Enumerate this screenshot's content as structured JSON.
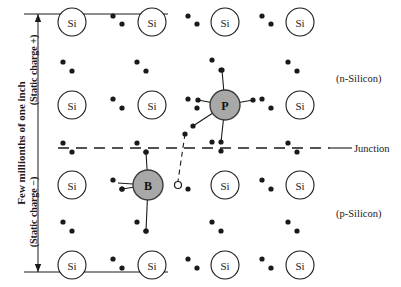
{
  "diagram": {
    "colors": {
      "ink": "#1a1a1a",
      "dopant_fill": "#a8a8a8",
      "atom_fill": "#ffffff",
      "background": "#ffffff"
    },
    "labels": {
      "dimension_main": "Few millionths of one inch",
      "static_charge_positive": "(Static charge +)",
      "static_charge_negative": "(Static charge −)",
      "n_region": "(n-Silicon)",
      "p_region": "(p-Silicon)",
      "junction": "Junction"
    },
    "atom_symbols": {
      "silicon": "Si",
      "phosphorus": "P",
      "boron": "B"
    },
    "silicon_atoms": [
      {
        "x": 72,
        "y": 22,
        "label": "Si"
      },
      {
        "x": 152,
        "y": 22,
        "label": "Si"
      },
      {
        "x": 225,
        "y": 22,
        "label": "Si"
      },
      {
        "x": 300,
        "y": 22,
        "label": "Si"
      },
      {
        "x": 72,
        "y": 105,
        "label": "Si"
      },
      {
        "x": 152,
        "y": 105,
        "label": "Si"
      },
      {
        "x": 300,
        "y": 105,
        "label": "Si"
      },
      {
        "x": 72,
        "y": 185,
        "label": "Si"
      },
      {
        "x": 225,
        "y": 185,
        "label": "Si"
      },
      {
        "x": 300,
        "y": 185,
        "label": "Si"
      },
      {
        "x": 72,
        "y": 265,
        "label": "Si"
      },
      {
        "x": 152,
        "y": 265,
        "label": "Si"
      },
      {
        "x": 225,
        "y": 265,
        "label": "Si"
      },
      {
        "x": 300,
        "y": 265,
        "label": "Si"
      }
    ],
    "dopant_atoms": [
      {
        "x": 225,
        "y": 105,
        "label": "P",
        "region": "n"
      },
      {
        "x": 148,
        "y": 185,
        "label": "B",
        "region": "p"
      }
    ],
    "hole": {
      "x": 178,
      "y": 185,
      "radius": 3.5
    },
    "electron_dots": [
      {
        "x": 113,
        "y": 16
      },
      {
        "x": 122,
        "y": 24
      },
      {
        "x": 188,
        "y": 16
      },
      {
        "x": 197,
        "y": 24
      },
      {
        "x": 262,
        "y": 16
      },
      {
        "x": 271,
        "y": 24
      },
      {
        "x": 63,
        "y": 62
      },
      {
        "x": 72,
        "y": 71
      },
      {
        "x": 137,
        "y": 62
      },
      {
        "x": 146,
        "y": 71
      },
      {
        "x": 212,
        "y": 60
      },
      {
        "x": 221,
        "y": 70
      },
      {
        "x": 288,
        "y": 62
      },
      {
        "x": 297,
        "y": 71
      },
      {
        "x": 113,
        "y": 99
      },
      {
        "x": 122,
        "y": 108
      },
      {
        "x": 188,
        "y": 99
      },
      {
        "x": 197,
        "y": 108
      },
      {
        "x": 262,
        "y": 99
      },
      {
        "x": 271,
        "y": 108
      },
      {
        "x": 63,
        "y": 143
      },
      {
        "x": 72,
        "y": 152
      },
      {
        "x": 137,
        "y": 143
      },
      {
        "x": 146,
        "y": 152
      },
      {
        "x": 212,
        "y": 142
      },
      {
        "x": 221,
        "y": 151
      },
      {
        "x": 288,
        "y": 143
      },
      {
        "x": 297,
        "y": 152
      },
      {
        "x": 113,
        "y": 180
      },
      {
        "x": 122,
        "y": 189
      },
      {
        "x": 188,
        "y": 189
      },
      {
        "x": 262,
        "y": 180
      },
      {
        "x": 271,
        "y": 189
      },
      {
        "x": 63,
        "y": 222
      },
      {
        "x": 72,
        "y": 231
      },
      {
        "x": 137,
        "y": 222
      },
      {
        "x": 146,
        "y": 231
      },
      {
        "x": 212,
        "y": 222
      },
      {
        "x": 221,
        "y": 231
      },
      {
        "x": 288,
        "y": 222
      },
      {
        "x": 297,
        "y": 231
      },
      {
        "x": 113,
        "y": 259
      },
      {
        "x": 122,
        "y": 268
      },
      {
        "x": 188,
        "y": 259
      },
      {
        "x": 197,
        "y": 268
      },
      {
        "x": 262,
        "y": 259
      },
      {
        "x": 271,
        "y": 268
      }
    ],
    "phosphorus_bonds": [
      {
        "x1": 225,
        "y1": 105,
        "x2": 198,
        "y2": 100,
        "dot": true
      },
      {
        "x1": 225,
        "y1": 105,
        "x2": 253,
        "y2": 100,
        "dot": true
      },
      {
        "x1": 225,
        "y1": 105,
        "x2": 222,
        "y2": 70,
        "dot": true
      },
      {
        "x1": 225,
        "y1": 105,
        "x2": 221,
        "y2": 142,
        "dot": true
      },
      {
        "x1": 225,
        "y1": 105,
        "x2": 193,
        "y2": 126,
        "dot": true
      }
    ],
    "boron_bonds": [
      {
        "x1": 148,
        "y1": 185,
        "x2": 122,
        "y2": 189,
        "dot": true
      },
      {
        "x1": 148,
        "y1": 185,
        "x2": 146,
        "y2": 152,
        "dot": true
      },
      {
        "x1": 148,
        "y1": 185,
        "x2": 146,
        "y2": 231,
        "dot": true
      },
      {
        "x1": 148,
        "y1": 185,
        "x2": 118,
        "y2": 183,
        "dot": false
      }
    ],
    "hole_path": {
      "x1": 185,
      "y1": 134,
      "x2": 178,
      "y2": 181
    },
    "junction_line": {
      "x1": 58,
      "y1": 148,
      "x2": 330,
      "y2": 148
    },
    "junction_leader": {
      "x1": 330,
      "y1": 148,
      "x2": 352,
      "y2": 148
    },
    "dimension_arrow": {
      "x": 38,
      "y1": 14,
      "y2": 272,
      "cap_half_width": 14
    }
  }
}
